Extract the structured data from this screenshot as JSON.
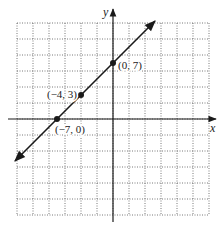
{
  "chart_data": {
    "type": "line",
    "title": "",
    "xlabel": "x",
    "ylabel": "y",
    "xlim": [
      -12,
      12
    ],
    "ylim": [
      -12,
      12
    ],
    "grid": true,
    "grid_step": 2,
    "grid_style": "dotted",
    "equation": "y = x + 7",
    "series": [
      {
        "name": "line",
        "slope": 1,
        "intercept": 7,
        "x": [
          -12.25,
          5.25
        ],
        "y": [
          -5.25,
          12.25
        ],
        "arrows": "both"
      }
    ],
    "points": [
      {
        "x": 0,
        "y": 7,
        "label": "(0, 7)"
      },
      {
        "x": -4,
        "y": 3,
        "label": "(−4, 3)"
      },
      {
        "x": -7,
        "y": 0,
        "label": "(−7, 0)"
      }
    ]
  },
  "colors": {
    "line": "#1a1a1a",
    "grid": "#555555",
    "background": "#ffffff"
  }
}
